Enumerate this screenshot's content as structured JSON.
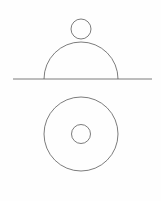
{
  "figure": {
    "background_color": "#fefefe",
    "line_color": "#5a5a5a",
    "line_width": 0.8,
    "canvas": {
      "width": 161,
      "height": 201
    },
    "views": [
      {
        "id": "front-elevation",
        "label": "Front elevation view",
        "elements": [
          {
            "id": "ground-line",
            "type": "line",
            "label": "Horizontal ground / section line",
            "x1": 13,
            "y1": 79,
            "x2": 152,
            "y2": 79
          },
          {
            "id": "dome-arc",
            "type": "semicircle",
            "label": "Hemispherical dome profile",
            "cx": 81,
            "cy": 79,
            "r": 37,
            "path": "M 44 79 A 37 37 0 0 1 118 79"
          },
          {
            "id": "apex-knob-circle",
            "type": "circle",
            "label": "Small knob circle at dome apex",
            "cx": 81,
            "cy": 29,
            "r": 10
          }
        ]
      },
      {
        "id": "plan-top",
        "label": "Plan (top) view",
        "elements": [
          {
            "id": "plan-outer-circle",
            "type": "circle",
            "label": "Outer circle — dome base projection",
            "cx": 81,
            "cy": 134,
            "r": 37
          },
          {
            "id": "plan-inner-circle",
            "type": "circle",
            "label": "Inner concentric circle — knob projection",
            "cx": 81,
            "cy": 134,
            "r": 9.5
          }
        ]
      }
    ]
  },
  "chart_data": {
    "type": "diagram",
    "xlabel": "",
    "ylabel": "",
    "xlim": [
      0,
      161
    ],
    "ylim": [
      0,
      201
    ],
    "grid": false,
    "legend": "none",
    "shapes": [
      {
        "name": "ground-line",
        "shape": "line",
        "x1": 13,
        "y1": 79,
        "x2": 152,
        "y2": 79
      },
      {
        "name": "dome-arc",
        "shape": "semicircle",
        "cx": 81,
        "cy": 79,
        "r": 37,
        "start_deg": 180,
        "end_deg": 360
      },
      {
        "name": "apex-knob-circle",
        "shape": "circle",
        "cx": 81,
        "cy": 29,
        "r": 10
      },
      {
        "name": "plan-outer-circle",
        "shape": "circle",
        "cx": 81,
        "cy": 134,
        "r": 37
      },
      {
        "name": "plan-inner-circle",
        "shape": "circle",
        "cx": 81,
        "cy": 134,
        "r": 9.5
      }
    ]
  }
}
